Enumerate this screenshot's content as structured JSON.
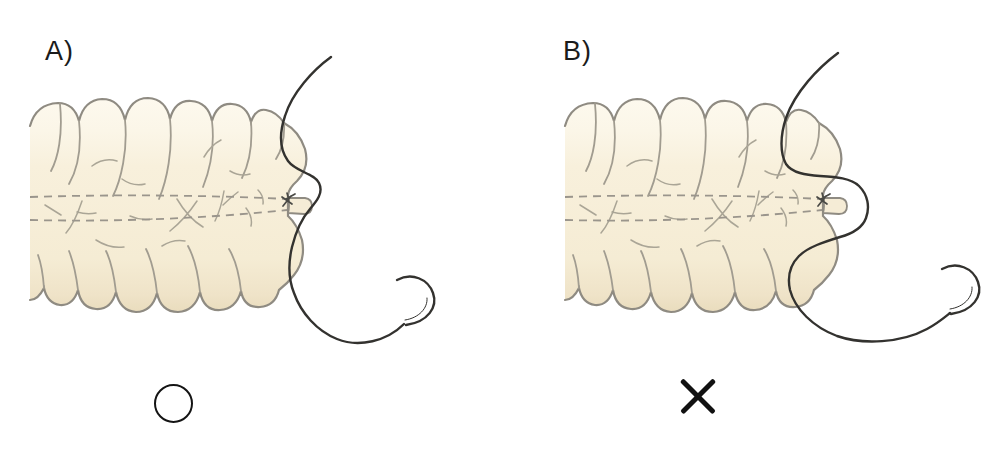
{
  "panels": [
    {
      "label": "A)",
      "mark": "circle"
    },
    {
      "label": "B)",
      "mark": "cross"
    }
  ],
  "illustration": {
    "subject": "bowel-with-appendix-stump-and-purse-string-suture",
    "elements": [
      "bowel",
      "taenia-dashed-lines",
      "appendix-stump",
      "ligature-knot",
      "suture-thread",
      "surgical-needle"
    ]
  },
  "colors": {
    "background": "#ffffff",
    "bowel_fill": "#f8f0dc",
    "bowel_highlight": "#fdf9ee",
    "bowel_shadow": "#e9dcbd",
    "outline": "#8f8b82",
    "detail_lines": "#a5a094",
    "suture_thread": "#33322f",
    "mark": "#111111"
  }
}
